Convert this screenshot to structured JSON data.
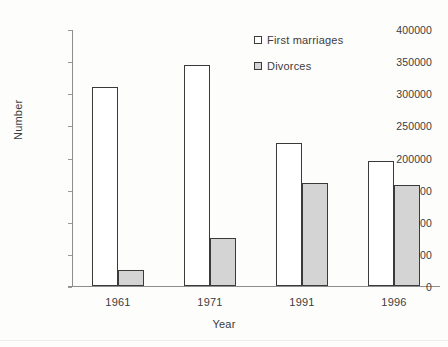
{
  "chart_data": {
    "type": "bar",
    "title": "",
    "xlabel": "Year",
    "ylabel": "Number",
    "categories": [
      "1961",
      "1971",
      "1991",
      "1996"
    ],
    "series": [
      {
        "name": "First marriages",
        "values": [
          310000,
          344000,
          222000,
          195000
        ],
        "color": "#ffffff"
      },
      {
        "name": "Divorces",
        "values": [
          25000,
          75000,
          160000,
          158000
        ],
        "color": "#d4d4d4"
      }
    ],
    "ylim": [
      0,
      400000
    ],
    "ytick_step": 50000,
    "ytick_labels": [
      "0",
      "50000",
      "100000",
      "150000",
      "200000",
      "250000",
      "300000",
      "350000",
      "400000"
    ],
    "grid": false,
    "legend_position": "top-right",
    "bar_outline_color": "#3a3a3a"
  },
  "legend": {
    "items": [
      {
        "label": "First marriages"
      },
      {
        "label": "Divorces"
      }
    ]
  },
  "axes": {
    "x_title": "Year",
    "y_title": "Number"
  }
}
